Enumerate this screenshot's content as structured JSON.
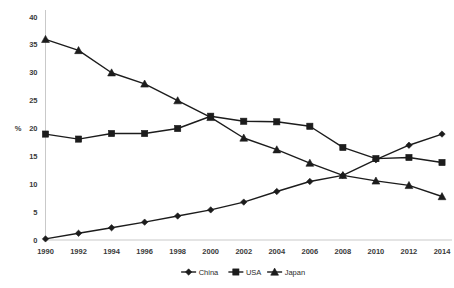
{
  "chart_data": {
    "type": "line",
    "title": "",
    "subtitle": "",
    "xlabel": "",
    "ylabel": "%",
    "categories": [
      1990,
      1992,
      1994,
      1996,
      1998,
      2000,
      2002,
      2004,
      2006,
      2008,
      2010,
      2012,
      2014
    ],
    "x_tick_labels": [
      "1990",
      "1992",
      "1994",
      "1996",
      "1998",
      "2000",
      "2002",
      "2004",
      "2006",
      "2008",
      "2010",
      "2012",
      "2014"
    ],
    "y_tick_labels": [
      "0",
      "5",
      "10",
      "15",
      "20",
      "25",
      "30",
      "35",
      "40"
    ],
    "y_tick_values": [
      0,
      5,
      10,
      15,
      20,
      25,
      30,
      35,
      40
    ],
    "ylim": [
      0,
      40
    ],
    "xlim": [
      1990,
      2014
    ],
    "grid": false,
    "legend_position": "bottom",
    "series": [
      {
        "name": "China",
        "marker": "diamond",
        "color": "#1c1c1c",
        "values": [
          0.2,
          1.2,
          2.2,
          3.2,
          4.3,
          5.4,
          6.8,
          8.7,
          10.5,
          11.6,
          14.4,
          17.0,
          19.0
        ]
      },
      {
        "name": "USA",
        "marker": "square",
        "color": "#1c1c1c",
        "values": [
          19.0,
          18.1,
          19.1,
          19.1,
          20.0,
          22.2,
          21.3,
          21.2,
          20.4,
          16.6,
          14.6,
          14.8,
          13.9
        ]
      },
      {
        "name": "Japan",
        "marker": "triangle",
        "color": "#1c1c1c",
        "values": [
          36.0,
          34.0,
          30.0,
          28.0,
          25.0,
          22.0,
          18.3,
          16.2,
          13.8,
          11.6,
          10.6,
          9.8,
          7.8
        ]
      }
    ]
  },
  "legend": {
    "items": [
      {
        "label": "China",
        "marker": "diamond"
      },
      {
        "label": "USA",
        "marker": "square"
      },
      {
        "label": "Japan",
        "marker": "triangle"
      }
    ]
  },
  "axes": {
    "y_unit_label": "%"
  }
}
